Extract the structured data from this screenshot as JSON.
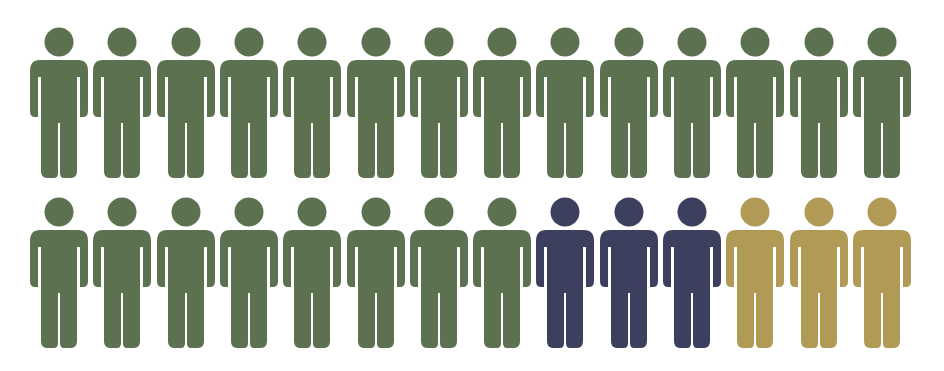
{
  "chart_data": {
    "type": "pictogram",
    "title": "",
    "unit_icon": "person-icon",
    "total": 28,
    "rows": 2,
    "per_row": 14,
    "categories": [
      "Green",
      "Navy",
      "Gold"
    ],
    "values": [
      22,
      3,
      3
    ],
    "colors": {
      "Green": "#5b7150",
      "Navy": "#3c3f5e",
      "Gold": "#b09a55"
    },
    "grid": false,
    "legend": null,
    "layout": [
      [
        "Green",
        "Green",
        "Green",
        "Green",
        "Green",
        "Green",
        "Green",
        "Green",
        "Green",
        "Green",
        "Green",
        "Green",
        "Green",
        "Green"
      ],
      [
        "Green",
        "Green",
        "Green",
        "Green",
        "Green",
        "Green",
        "Green",
        "Green",
        "Navy",
        "Navy",
        "Navy",
        "Gold",
        "Gold",
        "Gold"
      ]
    ]
  },
  "geometry": {
    "first_x": 30,
    "pitch_x": 63.3,
    "row_tops": [
      27,
      197
    ]
  }
}
